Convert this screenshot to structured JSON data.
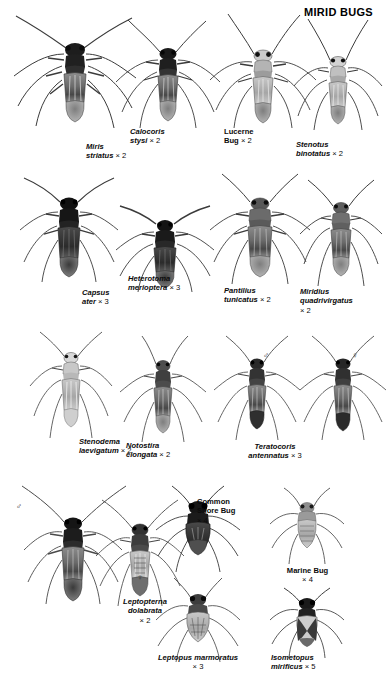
{
  "page": {
    "title": "MIRID BUGS",
    "background": "#ffffff",
    "ink": "#000000"
  },
  "symbols": {
    "male": "♂",
    "female": "♀"
  },
  "specimens": [
    {
      "id": "miris-striatus",
      "name_type": "scientific",
      "name": "Miris\nstriatus",
      "magnification": "× 2",
      "row": 1
    },
    {
      "id": "calocoris-stysi",
      "name_type": "scientific",
      "name": "Calocoris\nstysi",
      "magnification": "× 2",
      "row": 1
    },
    {
      "id": "lucerne-bug",
      "name_type": "common",
      "name": "Lucerne\nBug",
      "magnification": "× 2",
      "row": 1
    },
    {
      "id": "stenotus-binotatus",
      "name_type": "scientific",
      "name": "Stenotus\nbinotatus",
      "magnification": "× 2",
      "row": 1
    },
    {
      "id": "capsus-ater",
      "name_type": "scientific",
      "name": "Capsus\nater",
      "magnification": "× 3",
      "row": 2
    },
    {
      "id": "heterotoma-merioptera",
      "name_type": "scientific",
      "name": "Heterotoma\nmerioptera",
      "magnification": "× 3",
      "row": 2
    },
    {
      "id": "pantilius-tunicatus",
      "name_type": "scientific",
      "name": "Pantilius\ntunicatus",
      "magnification": "× 2",
      "row": 2
    },
    {
      "id": "miridius-quadrivirgatus",
      "name_type": "scientific",
      "name": "Miridius\nquadrivirgatus",
      "magnification": "× 2",
      "row": 2
    },
    {
      "id": "stenodema-laevigatum",
      "name_type": "scientific",
      "name": "Stenodema\nlaevigatum",
      "magnification": "× 2",
      "row": 3
    },
    {
      "id": "notostira-elongata",
      "name_type": "scientific",
      "name": "Notostira\nelongata",
      "magnification": "× 2",
      "row": 3
    },
    {
      "id": "teratocoris-antennatus",
      "name_type": "scientific",
      "name": "Teratocoris\nantennatus",
      "magnification": "× 3",
      "row": 3,
      "sexes": [
        "male",
        "female"
      ]
    },
    {
      "id": "leptopterna-dolabrata",
      "name_type": "scientific",
      "name": "Leptopterna\ndolabrata",
      "magnification": "× 2",
      "row": 4,
      "sexes": [
        "male",
        "female"
      ]
    },
    {
      "id": "common-shore-bug",
      "name_type": "common",
      "name": "Common\nShore Bug",
      "magnification": "× 4",
      "row": 4
    },
    {
      "id": "leptopus-marmoratus",
      "name_type": "scientific",
      "name": "Leptopus marmoratus",
      "magnification": "× 3",
      "row": 4
    },
    {
      "id": "marine-bug",
      "name_type": "common",
      "name": "Marine Bug",
      "magnification": "× 4",
      "row": 4
    },
    {
      "id": "isometopus-mirificus",
      "name_type": "scientific",
      "name": "Isometopus\nmirificus",
      "magnification": "× 5",
      "row": 4
    }
  ]
}
